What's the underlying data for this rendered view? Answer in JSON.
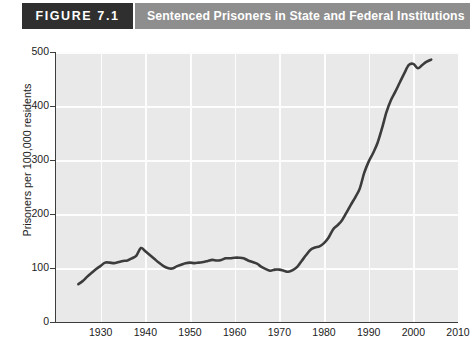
{
  "figure": {
    "tag": "FIGURE 7.1",
    "title": "Sentenced Prisoners in State and Federal Institutions"
  },
  "colors": {
    "tag_background": "#2f2f2f",
    "titlebar_background": "#8e8e8e",
    "plot_background": "#e9e9e9",
    "gridline": "#fdfdfd",
    "axis": "#3d3d3d",
    "line": "#3c3c3c",
    "page_background": "#ffffff"
  },
  "chart_data": {
    "type": "line",
    "title": "Sentenced Prisoners in State and Federal Institutions",
    "xlabel": "",
    "ylabel": "Prisoners per 100,000 residents",
    "xlim": [
      1920,
      2010
    ],
    "ylim": [
      0,
      500
    ],
    "xticks": [
      1930,
      1940,
      1950,
      1960,
      1970,
      1980,
      1990,
      2000,
      2010
    ],
    "xtick_labels": [
      "1930",
      "1940",
      "1950",
      "1960",
      "1970",
      "1980",
      "1990",
      "2000",
      "2010"
    ],
    "yticks": [
      0,
      100,
      200,
      300,
      400,
      500
    ],
    "ytick_labels": [
      "0",
      "100",
      "200",
      "300",
      "400",
      "500"
    ],
    "grid": true,
    "legend": null,
    "series": [
      {
        "name": "Sentenced prisoners per 100,000 residents",
        "x": [
          1925,
          1926,
          1927,
          1928,
          1929,
          1930,
          1931,
          1932,
          1933,
          1934,
          1935,
          1936,
          1937,
          1938,
          1939,
          1940,
          1941,
          1942,
          1943,
          1944,
          1945,
          1946,
          1947,
          1948,
          1949,
          1950,
          1951,
          1952,
          1953,
          1954,
          1955,
          1956,
          1957,
          1958,
          1959,
          1960,
          1961,
          1962,
          1963,
          1964,
          1965,
          1966,
          1967,
          1968,
          1969,
          1970,
          1971,
          1972,
          1973,
          1974,
          1975,
          1976,
          1977,
          1978,
          1979,
          1980,
          1981,
          1982,
          1983,
          1984,
          1985,
          1986,
          1987,
          1988,
          1989,
          1990,
          1991,
          1992,
          1993,
          1994,
          1995,
          1996,
          1997,
          1998,
          1999,
          2000,
          2001,
          2002,
          2003,
          2004
        ],
        "y": [
          70,
          76,
          84,
          91,
          98,
          104,
          110,
          110,
          109,
          111,
          113,
          114,
          118,
          123,
          137,
          131,
          124,
          117,
          110,
          104,
          100,
          99,
          103,
          106,
          109,
          110,
          109,
          110,
          111,
          113,
          115,
          114,
          115,
          118,
          118,
          119,
          119,
          118,
          114,
          111,
          108,
          102,
          98,
          95,
          97,
          97,
          95,
          93,
          96,
          102,
          113,
          124,
          134,
          138,
          140,
          146,
          156,
          171,
          179,
          188,
          202,
          217,
          231,
          247,
          276,
          297,
          313,
          332,
          359,
          389,
          411,
          427,
          444,
          461,
          476,
          478,
          470,
          476,
          482,
          486
        ]
      }
    ],
    "annotations": []
  }
}
